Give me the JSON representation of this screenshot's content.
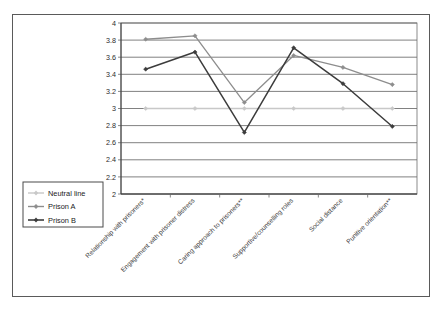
{
  "chart_data": {
    "type": "line",
    "title": "",
    "subtitle": "",
    "xlabel": "",
    "ylabel": "",
    "ylim": [
      2,
      4
    ],
    "ytick_step": 0.2,
    "yticks": [
      "4",
      "3.8",
      "3.6",
      "3.4",
      "3.2",
      "3",
      "2.8",
      "2.6",
      "2.4",
      "2.2",
      "2"
    ],
    "grid": true,
    "legend_position": "bottom-left-outside",
    "categories": [
      "Relationship with prisoners*",
      "Engagement with prisoner distress",
      "Caring approach to prisoners**",
      "Supportive/counselling roles",
      "Social distance",
      "Punitive orientation**"
    ],
    "series": [
      {
        "name": "Neutral line",
        "color": "#c8c8c8",
        "marker": "diamond",
        "values": [
          3.0,
          3.0,
          3.0,
          3.0,
          3.0,
          3.0
        ]
      },
      {
        "name": "Prison A",
        "color": "#8d8d8d",
        "marker": "diamond",
        "values": [
          3.81,
          3.85,
          3.07,
          3.62,
          3.48,
          3.28
        ]
      },
      {
        "name": "Prison B",
        "color": "#3c3c3c",
        "marker": "diamond",
        "values": [
          3.46,
          3.66,
          2.72,
          3.71,
          3.29,
          2.79
        ]
      }
    ]
  },
  "legend": {
    "entries": [
      {
        "label": "Neutral line"
      },
      {
        "label": "Prison A"
      },
      {
        "label": "Prison B"
      }
    ]
  }
}
